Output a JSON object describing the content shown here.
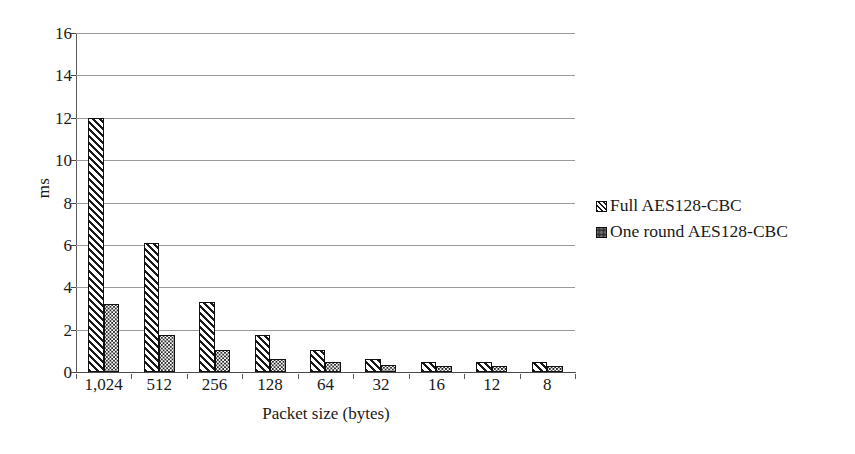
{
  "chart_data": {
    "type": "bar",
    "title": "",
    "xlabel": "Packet size (bytes)",
    "ylabel": "ms",
    "categories": [
      "1,024",
      "512",
      "256",
      "128",
      "64",
      "32",
      "16",
      "12",
      "8"
    ],
    "series": [
      {
        "name": "Full AES128-CBC",
        "pattern": "diagonal-hatch",
        "values": [
          12.0,
          6.1,
          3.3,
          1.75,
          1.05,
          0.6,
          0.45,
          0.45,
          0.45
        ]
      },
      {
        "name": "One round AES128-CBC",
        "pattern": "dotted-stipple",
        "values": [
          3.2,
          1.75,
          1.05,
          0.6,
          0.45,
          0.35,
          0.3,
          0.3,
          0.3
        ]
      }
    ],
    "ylim": [
      0,
      16
    ],
    "yticks": [
      0,
      2,
      4,
      6,
      8,
      10,
      12,
      14,
      16
    ],
    "ytick_labels": [
      "0",
      "2",
      "4",
      "6",
      "8",
      "10",
      "12",
      "14",
      "16"
    ],
    "grid": true,
    "grid_axis": "y",
    "legend_position": "right",
    "colors": {
      "bar_outline": "#111111",
      "gridline": "#9a9a9a",
      "axis": "#4a4a4a",
      "text": "#1a1a1a",
      "background": "#ffffff"
    }
  },
  "legend": {
    "entries": [
      {
        "label": "Full AES128-CBC",
        "swatch": "hatch-swatch-icon"
      },
      {
        "label": "One round AES128-CBC",
        "swatch": "dots-swatch-icon"
      }
    ]
  }
}
